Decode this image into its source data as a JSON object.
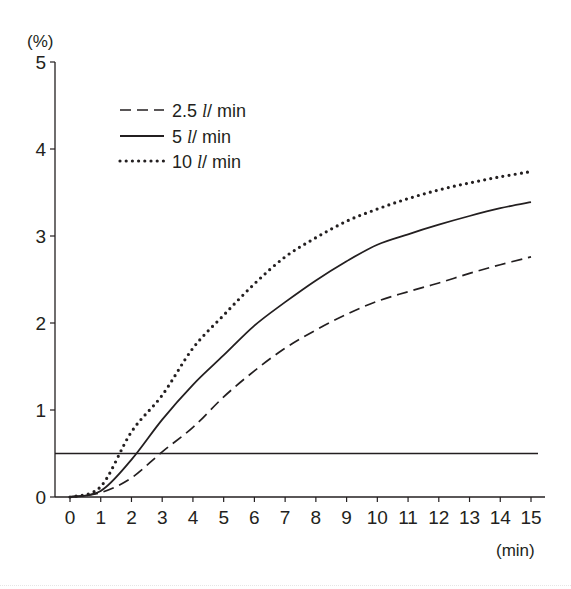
{
  "chart_data": {
    "type": "line",
    "title": "",
    "xlabel": "(min)",
    "ylabel": "(%)",
    "xlim": [
      0,
      15
    ],
    "ylim": [
      0,
      5
    ],
    "x_ticks": [
      0,
      1,
      2,
      3,
      4,
      5,
      6,
      7,
      8,
      9,
      10,
      11,
      12,
      13,
      14,
      15
    ],
    "y_ticks": [
      0,
      1,
      2,
      3,
      4,
      5
    ],
    "grid": false,
    "legend_position": "upper-left",
    "x": [
      0,
      1,
      2,
      3,
      4,
      5,
      6,
      7,
      8,
      9,
      10,
      11,
      12,
      13,
      14,
      15
    ],
    "series": [
      {
        "name": "2.5 l/ min",
        "legend_number": "2.5",
        "legend_unit_l": "l",
        "legend_unit_rest": "/ min",
        "style": "dashed",
        "color": "#231f20",
        "values": [
          0,
          0.05,
          0.22,
          0.52,
          0.8,
          1.15,
          1.45,
          1.71,
          1.92,
          2.1,
          2.25,
          2.36,
          2.46,
          2.57,
          2.67,
          2.76
        ]
      },
      {
        "name": "5 l/ min",
        "legend_number": "5",
        "legend_unit_l": "l",
        "legend_unit_rest": "/ min",
        "style": "solid",
        "color": "#231f20",
        "values": [
          0,
          0.07,
          0.43,
          0.89,
          1.29,
          1.63,
          1.97,
          2.24,
          2.49,
          2.71,
          2.9,
          3.02,
          3.13,
          3.23,
          3.32,
          3.39
        ]
      },
      {
        "name": "10 l/ min",
        "legend_number": "10",
        "legend_unit_l": "l",
        "legend_unit_rest": "/ min",
        "style": "dotted",
        "color": "#231f20",
        "values": [
          0,
          0.12,
          0.75,
          1.17,
          1.71,
          2.09,
          2.45,
          2.76,
          2.98,
          3.17,
          3.31,
          3.43,
          3.53,
          3.61,
          3.68,
          3.74
        ]
      }
    ],
    "reference_lines": [
      {
        "type": "horizontal",
        "y": 0.5,
        "x_from": 0,
        "x_to": 15,
        "style": "solid"
      }
    ]
  },
  "axes": {
    "y_unit": "(%)",
    "x_unit": "(min)"
  }
}
